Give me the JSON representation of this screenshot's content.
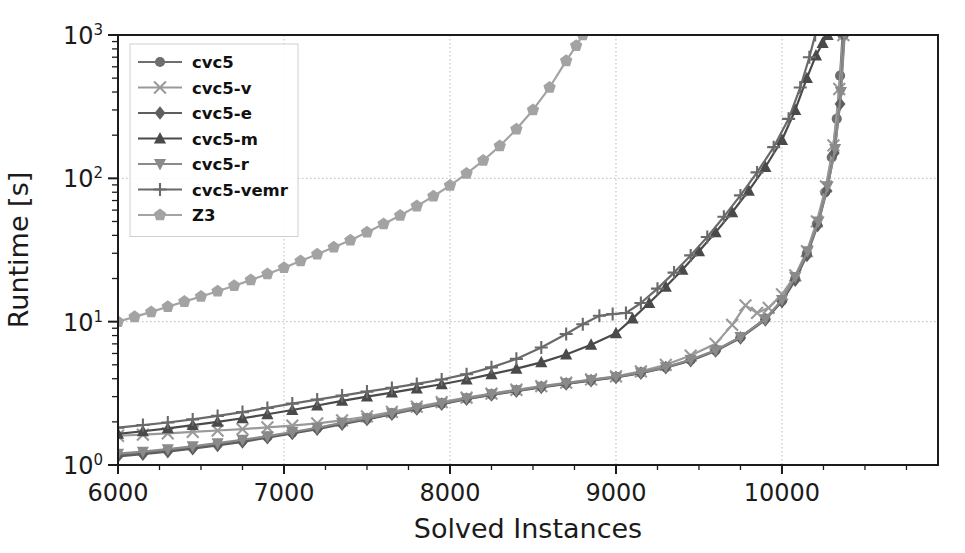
{
  "chart_data": {
    "type": "line",
    "title": "",
    "xlabel": "Solved Instances",
    "ylabel": "Runtime [s]",
    "xlim": [
      6000,
      10940
    ],
    "ylim": [
      1,
      1000
    ],
    "yscale": "log",
    "xticks": [
      6000,
      7000,
      8000,
      9000,
      10000
    ],
    "xtick_labels": [
      "6000",
      "7000",
      "8000",
      "9000",
      "10000"
    ],
    "yticks": [
      1,
      10,
      100,
      1000
    ],
    "ytick_labels": [
      "10^0",
      "10^1",
      "10^2",
      "10^3"
    ],
    "ytick_mantissa": "10",
    "ytick_exponents": [
      "0",
      "1",
      "2",
      "3"
    ],
    "grid": true,
    "grid_style": "dotted",
    "legend_position": "upper left",
    "series": [
      {
        "name": "cvc5",
        "marker": "circle",
        "color": "#6e6e6e",
        "x": [
          6000,
          6150,
          6300,
          6450,
          6600,
          6750,
          6900,
          7050,
          7200,
          7350,
          7500,
          7650,
          7800,
          7950,
          8100,
          8250,
          8400,
          8550,
          8700,
          8850,
          9000,
          9150,
          9300,
          9450,
          9600,
          9750,
          9900,
          10000,
          10080,
          10150,
          10210,
          10260,
          10300,
          10330,
          10350,
          10365
        ],
        "y": [
          1.18,
          1.22,
          1.27,
          1.33,
          1.4,
          1.48,
          1.57,
          1.68,
          1.8,
          1.95,
          2.1,
          2.28,
          2.48,
          2.68,
          2.9,
          3.1,
          3.3,
          3.5,
          3.7,
          3.9,
          4.1,
          4.4,
          4.8,
          5.4,
          6.3,
          7.8,
          10.5,
          14.0,
          20.0,
          30.0,
          48.0,
          80.0,
          140.0,
          260.0,
          520.0,
          1000.0
        ]
      },
      {
        "name": "cvc5-v",
        "marker": "x",
        "color": "#9a9a9a",
        "x": [
          6000,
          6150,
          6300,
          6450,
          6600,
          6750,
          6900,
          7050,
          7200,
          7350,
          7500,
          7650,
          7800,
          7950,
          8100,
          8250,
          8400,
          8550,
          8700,
          8850,
          9000,
          9150,
          9300,
          9450,
          9600,
          9700,
          9780,
          9850,
          9920,
          10000,
          10080,
          10150,
          10210,
          10265,
          10310,
          10345,
          10370
        ],
        "y": [
          1.6,
          1.63,
          1.66,
          1.7,
          1.74,
          1.78,
          1.83,
          1.88,
          1.95,
          2.05,
          2.18,
          2.35,
          2.55,
          2.75,
          2.95,
          3.15,
          3.35,
          3.55,
          3.75,
          3.95,
          4.15,
          4.5,
          5.0,
          5.8,
          7.0,
          9.5,
          13.0,
          11.5,
          12.5,
          15.5,
          21.0,
          31.0,
          50.0,
          88.0,
          170.0,
          420.0,
          1000.0
        ]
      },
      {
        "name": "cvc5-e",
        "marker": "diamond",
        "color": "#5e5e5e",
        "x": [
          6000,
          6150,
          6300,
          6450,
          6600,
          6750,
          6900,
          7050,
          7200,
          7350,
          7500,
          7650,
          7800,
          7950,
          8100,
          8250,
          8400,
          8550,
          8700,
          8850,
          9000,
          9150,
          9300,
          9450,
          9600,
          9750,
          9900,
          10000,
          10080,
          10150,
          10215,
          10270,
          10315,
          10350,
          10375
        ],
        "y": [
          1.15,
          1.19,
          1.24,
          1.3,
          1.37,
          1.45,
          1.55,
          1.66,
          1.78,
          1.93,
          2.08,
          2.26,
          2.46,
          2.66,
          2.88,
          3.08,
          3.28,
          3.48,
          3.68,
          3.88,
          4.08,
          4.38,
          4.78,
          5.35,
          6.25,
          7.7,
          10.3,
          13.8,
          19.5,
          29.0,
          47.0,
          82.0,
          150.0,
          330.0,
          1000.0
        ]
      },
      {
        "name": "cvc5-m",
        "marker": "triangle-up",
        "color": "#4a4a4a",
        "x": [
          6000,
          6150,
          6300,
          6450,
          6600,
          6750,
          6900,
          7050,
          7200,
          7350,
          7500,
          7650,
          7800,
          7950,
          8100,
          8250,
          8400,
          8550,
          8700,
          8850,
          9000,
          9100,
          9200,
          9300,
          9400,
          9500,
          9600,
          9700,
          9800,
          9900,
          10000,
          10080,
          10150,
          10205,
          10245,
          10275
        ],
        "y": [
          1.65,
          1.72,
          1.8,
          1.9,
          2.0,
          2.12,
          2.26,
          2.42,
          2.6,
          2.8,
          3.0,
          3.2,
          3.42,
          3.66,
          3.95,
          4.3,
          4.7,
          5.2,
          5.9,
          6.9,
          8.3,
          10.5,
          13.5,
          17.5,
          23.0,
          31.0,
          42.0,
          58.0,
          82.0,
          120.0,
          185.0,
          300.0,
          500.0,
          720.0,
          880.0,
          1000.0
        ]
      },
      {
        "name": "cvc5-r",
        "marker": "triangle-down",
        "color": "#8a8a8a",
        "x": [
          6000,
          6150,
          6300,
          6450,
          6600,
          6750,
          6900,
          7050,
          7200,
          7350,
          7500,
          7650,
          7800,
          7950,
          8100,
          8250,
          8400,
          8550,
          8700,
          8850,
          9000,
          9150,
          9300,
          9450,
          9600,
          9750,
          9900,
          10000,
          10080,
          10155,
          10220,
          10275,
          10320,
          10355,
          10378
        ],
        "y": [
          1.2,
          1.24,
          1.29,
          1.35,
          1.42,
          1.5,
          1.59,
          1.7,
          1.82,
          1.97,
          2.12,
          2.3,
          2.5,
          2.7,
          2.92,
          3.12,
          3.32,
          3.52,
          3.72,
          3.92,
          4.12,
          4.42,
          4.82,
          5.42,
          6.32,
          7.82,
          10.4,
          14.2,
          20.5,
          31.0,
          50.0,
          88.0,
          160.0,
          400.0,
          1000.0
        ]
      },
      {
        "name": "cvc5-vemr",
        "marker": "plus",
        "color": "#6a6a6a",
        "x": [
          6000,
          6150,
          6300,
          6450,
          6600,
          6750,
          6900,
          7050,
          7200,
          7350,
          7500,
          7650,
          7800,
          7950,
          8100,
          8250,
          8400,
          8550,
          8700,
          8800,
          8900,
          8980,
          9060,
          9150,
          9250,
          9350,
          9450,
          9550,
          9650,
          9750,
          9850,
          9950,
          10040,
          10110,
          10165,
          10200
        ],
        "y": [
          1.82,
          1.9,
          1.98,
          2.08,
          2.2,
          2.34,
          2.5,
          2.68,
          2.86,
          3.05,
          3.25,
          3.45,
          3.68,
          3.95,
          4.3,
          4.8,
          5.5,
          6.6,
          8.2,
          9.6,
          11.0,
          11.3,
          11.5,
          13.5,
          17.0,
          22.0,
          29.0,
          39.0,
          54.0,
          76.0,
          110.0,
          165.0,
          260.0,
          430.0,
          700.0,
          1000.0
        ]
      },
      {
        "name": "Z3",
        "marker": "pentagon",
        "color": "#a3a3a3",
        "x": [
          6000,
          6100,
          6200,
          6300,
          6400,
          6500,
          6600,
          6700,
          6800,
          6900,
          7000,
          7100,
          7200,
          7300,
          7400,
          7500,
          7600,
          7700,
          7800,
          7900,
          8000,
          8100,
          8200,
          8300,
          8400,
          8500,
          8600,
          8700,
          8760,
          8800
        ],
        "y": [
          10.0,
          10.8,
          11.7,
          12.7,
          13.8,
          15.0,
          16.3,
          17.8,
          19.5,
          21.5,
          23.8,
          26.5,
          29.5,
          33.0,
          37.0,
          42.0,
          48.0,
          55.0,
          64.0,
          75.0,
          89.0,
          108.0,
          133.0,
          168.0,
          220.0,
          300.0,
          430.0,
          660.0,
          840.0,
          1000.0
        ]
      }
    ]
  },
  "legend": {
    "entries": [
      {
        "label": "cvc5"
      },
      {
        "label": "cvc5-v"
      },
      {
        "label": "cvc5-e"
      },
      {
        "label": "cvc5-m"
      },
      {
        "label": "cvc5-r"
      },
      {
        "label": "cvc5-vemr"
      },
      {
        "label": "Z3"
      }
    ]
  },
  "axes": {
    "x_title": "Solved Instances",
    "y_title": "Runtime [s]"
  },
  "colors": {
    "background": "#ffffff",
    "axis": "#1b1b1b",
    "grid": "#b9b9b9"
  }
}
